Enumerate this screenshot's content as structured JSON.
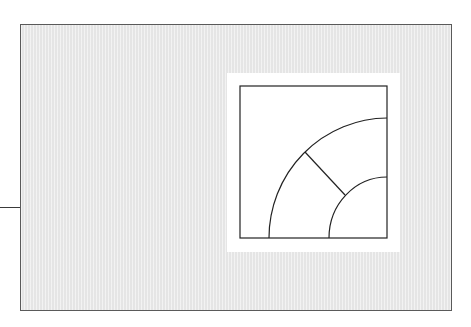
{
  "figure": {
    "label": "Quarter-circle arch tile detail",
    "panel": {
      "background": "#ececec",
      "border": "#5a5a5a"
    },
    "frame": {
      "background": "#ffffff"
    },
    "detail": {
      "square": {
        "x": 240,
        "y": 86,
        "width": 147,
        "height": 152
      },
      "corner_center": {
        "x": 387,
        "y": 238
      },
      "outer_arc_radius": 119,
      "inner_arc_radius": 60,
      "radial_segment": {
        "x1": 305,
        "y1": 152,
        "x2": 345,
        "y2": 195
      },
      "line_color": "#222222"
    },
    "leader_line": {
      "x1": 0,
      "y1": 207,
      "x2": 21,
      "y2": 207
    }
  }
}
